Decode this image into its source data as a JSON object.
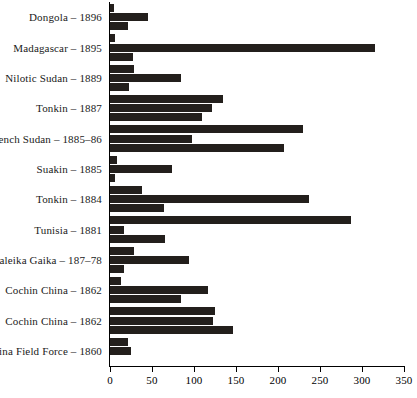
{
  "chart_data": {
    "type": "bar",
    "orientation": "horizontal",
    "title": "",
    "subtitle": "",
    "xlabel": "",
    "ylabel": "",
    "xlim": [
      0,
      350
    ],
    "ylim": null,
    "grid": false,
    "legend": null,
    "legend_position": "none",
    "bar_color": "#231f1c",
    "axis_color": "#000000",
    "background": "#ffffff",
    "xticks": [
      0,
      50,
      100,
      150,
      200,
      250,
      300,
      350
    ],
    "xtick_labels": [
      "0",
      "50",
      "100",
      "150",
      "200",
      "250",
      "300",
      "350"
    ],
    "categories": [
      "Dongola – 1896",
      "Madagascar – 1895",
      "Nilotic Sudan – 1889",
      "Tonkin – 1887",
      "French Sudan – 1885–86",
      "Suakin – 1885",
      "Tonkin – 1884",
      "Tunisia – 1881",
      "Galeika Gaika – 187–78",
      "Cochin China – 1862",
      "Cochin China – 1862",
      "China Field Force – 1860"
    ],
    "bars_per_group": 3,
    "groups": [
      {
        "category": "Dongola – 1896",
        "values": [
          5,
          45,
          22
        ]
      },
      {
        "category": "Madagascar – 1895",
        "values": [
          6,
          315,
          27
        ]
      },
      {
        "category": "Nilotic Sudan – 1889",
        "values": [
          28,
          85,
          23
        ]
      },
      {
        "category": "Tonkin – 1887",
        "values": [
          135,
          121,
          110
        ]
      },
      {
        "category": "French Sudan – 1885–86",
        "values": [
          230,
          98,
          207
        ]
      },
      {
        "category": "Suakin – 1885",
        "values": [
          8,
          74,
          6
        ]
      },
      {
        "category": "Tonkin – 1884",
        "values": [
          38,
          237,
          64
        ]
      },
      {
        "category": "Tunisia – 1881",
        "values": [
          287,
          17,
          66
        ]
      },
      {
        "category": "Galeika Gaika – 187–78",
        "values": [
          28,
          94,
          17
        ]
      },
      {
        "category": "Cochin China – 1862",
        "values": [
          13,
          117,
          85
        ]
      },
      {
        "category": "Cochin China – 1862",
        "values": [
          125,
          123,
          146
        ]
      },
      {
        "category": "China Field Force – 1860",
        "values": [
          22,
          25,
          0
        ]
      }
    ],
    "series": [
      {
        "name": "bar-1",
        "values": [
          5,
          6,
          28,
          135,
          230,
          8,
          38,
          287,
          28,
          13,
          125,
          22
        ]
      },
      {
        "name": "bar-2",
        "values": [
          45,
          315,
          85,
          121,
          98,
          74,
          237,
          17,
          94,
          117,
          123,
          25
        ]
      },
      {
        "name": "bar-3",
        "values": [
          22,
          27,
          23,
          110,
          207,
          6,
          64,
          66,
          17,
          85,
          146,
          0
        ]
      }
    ]
  }
}
